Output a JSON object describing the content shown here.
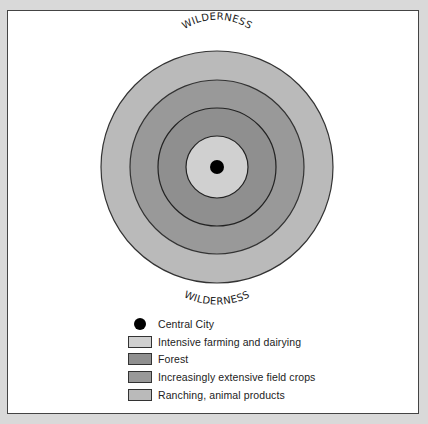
{
  "diagram": {
    "type": "concentric-land-use-model",
    "top_label": "WILDERNESS",
    "bottom_label": "WILDERNESS",
    "center": {
      "x": 217,
      "y": 167
    },
    "rings": [
      {
        "name": "Ranching, animal products",
        "radius": 116,
        "color": "#bababa"
      },
      {
        "name": "Increasingly extensive field crops",
        "radius": 87,
        "color": "#999999"
      },
      {
        "name": "Forest",
        "radius": 59,
        "color": "#8f8f8f"
      },
      {
        "name": "Intensive farming and dairying",
        "radius": 31,
        "color": "#d0d0d0"
      }
    ],
    "central_city": {
      "radius": 7,
      "color": "#000000"
    }
  },
  "legend": {
    "items": [
      {
        "label": "Central City",
        "kind": "dot",
        "color": "#000000"
      },
      {
        "label": "Intensive farming and dairying",
        "kind": "swatch",
        "color": "#d0d0d0"
      },
      {
        "label": "Forest",
        "kind": "swatch",
        "color": "#8f8f8f"
      },
      {
        "label": "Increasingly extensive field crops",
        "kind": "swatch",
        "color": "#999999"
      },
      {
        "label": "Ranching, animal products",
        "kind": "swatch",
        "color": "#bababa"
      }
    ]
  }
}
